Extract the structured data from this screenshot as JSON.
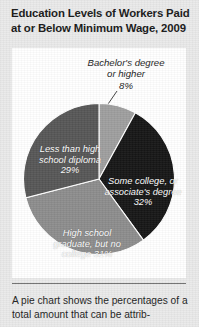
{
  "figure": {
    "title": "Education Levels of Workers Paid at or Below Minimum Wage, 2009"
  },
  "callout": {
    "line1": "Bachelor's degree",
    "line2": "or higher",
    "line3": "8%"
  },
  "pie_labels": {
    "less_than_hs": "Less than high school diploma 29%",
    "some_college": "Some college, or associate's degree 32%",
    "hs_graduate": "High school graduate, but no college 31%"
  },
  "caption": {
    "text": "A pie chart shows the percentages of a total amount that can be attrib-"
  },
  "colors": {
    "bachelors": "#9e9e9e",
    "some_college": "#151515",
    "hs_graduate": "#8c8c8c",
    "less_than_hs": "#565656",
    "background": "#e9e9e9",
    "card": "#ffffff",
    "text": "#171717"
  },
  "chart_data": {
    "type": "pie",
    "title": "Education Levels of Workers Paid at or Below Minimum Wage, 2009",
    "subtitle": "",
    "xlabel": "",
    "ylabel": "",
    "legend_position": "inside-slices",
    "grid": false,
    "units": "percent",
    "categories": [
      "Bachelor's degree or higher",
      "Some college, or associate's degree",
      "High school graduate, but no college",
      "Less than high school diploma"
    ],
    "values": [
      8,
      32,
      31,
      29
    ],
    "slice_colors": [
      "#9e9e9e",
      "#151515",
      "#8c8c8c",
      "#565656"
    ],
    "data_labels": [
      "8%",
      "32%",
      "31%",
      "29%"
    ],
    "start_angle_deg": 0,
    "direction": "clockwise",
    "annotations": [
      {
        "text": "Bachelor's degree or higher 8%",
        "target_category": "Bachelor's degree or higher",
        "type": "leader-line-callout"
      }
    ]
  }
}
